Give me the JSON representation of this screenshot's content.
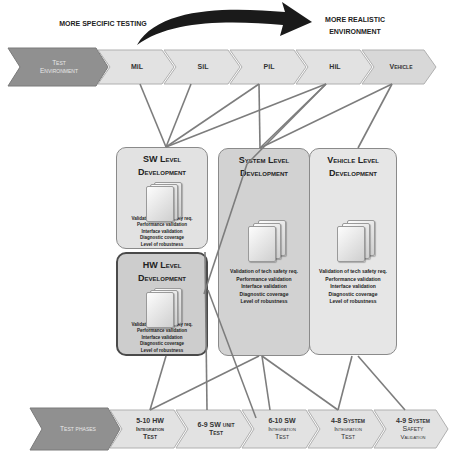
{
  "arrow": {
    "left_label": "MORE SPECIFIC TESTING",
    "right_label_line1": "MORE REALISTIC",
    "right_label_line2": "ENVIRONMENT"
  },
  "test_environment": {
    "header_line1": "Test",
    "header_line2": "Environment",
    "stages": [
      {
        "label": "MiL"
      },
      {
        "label": "SiL"
      },
      {
        "label": "PiL"
      },
      {
        "label": "HiL"
      },
      {
        "label": "Vehicle"
      }
    ]
  },
  "boxes": {
    "sw": {
      "title_line1": "SW Level",
      "title_line2": "Development",
      "items": [
        "Validation of tech safety req.",
        "Performance validation",
        "Interface validation",
        "Diagnostic coverage",
        "Level of robustness"
      ]
    },
    "hw": {
      "title_line1": "HW Level",
      "title_line2": "Development",
      "items": [
        "Validation of tech safety req.",
        "Performance validation",
        "Interface validation",
        "Diagnostic coverage",
        "Level of robustness"
      ]
    },
    "system": {
      "title_line1": "System Level",
      "title_line2": "Development",
      "items": [
        "Validation of tech safety req.",
        "Performance validation",
        "Interface validation",
        "Diagnostic coverage",
        "Level of robustness"
      ]
    },
    "vehicle": {
      "title_line1": "Vehicle Level",
      "title_line2": "Development",
      "items": [
        "Validation of tech safety req.",
        "Performance validation",
        "Interface validation",
        "Diagnostic coverage",
        "Level of robustness"
      ]
    }
  },
  "test_phases": {
    "header": "Test phases",
    "phases": [
      {
        "line1": "5-10 HW",
        "line2": "Integration",
        "line3": "Test"
      },
      {
        "line1": "6-9 SW unit",
        "line2": "Test",
        "line3": ""
      },
      {
        "line1": "6-10 SW",
        "line2": "Integration",
        "line3": "Test"
      },
      {
        "line1": "4-8 System",
        "line2": "Integration",
        "line3": "Test"
      },
      {
        "line1": "4-9 System",
        "line2": "Safety",
        "line3": "Validation"
      }
    ]
  },
  "colors": {
    "header_chevron": "#8f8f8f",
    "stage_chevron": "#e0e0e0",
    "sw_box": "#e2e2e2",
    "hw_box": "#cdcdcd",
    "system_box": "#d2d2d2",
    "vehicle_box": "#e6e6e6",
    "connector_line": "#7d7d7d",
    "arrow": "#1a1a1a"
  }
}
